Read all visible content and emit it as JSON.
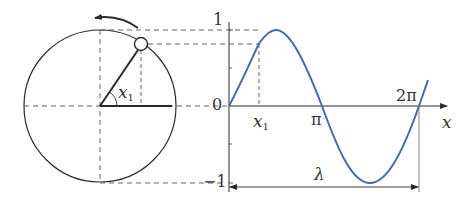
{
  "figure": {
    "colors": {
      "ink": "#2a2a2a",
      "dash": "#555555",
      "curve": "#4a68b0",
      "background": "#ffffff"
    }
  },
  "circle": {
    "angle_label": "x",
    "angle_subscript": "1",
    "rotation_arrow": "counterclockwise"
  },
  "graph": {
    "y_ticks": {
      "top": "1",
      "zero": "0",
      "bottom": "−1"
    },
    "x_ticks": {
      "x1_label": "x",
      "x1_subscript": "1",
      "pi": "π",
      "two_pi": "2π"
    },
    "x_axis_label": "x",
    "wavelength_label": "λ"
  }
}
